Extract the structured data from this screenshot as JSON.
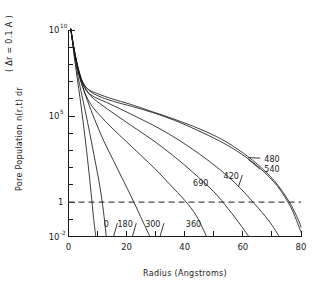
{
  "chart_data": {
    "type": "line",
    "title": "",
    "xlabel": "Radius (Angstroms)",
    "ylabel_main": "Pore Population  n(r,t) dr",
    "ylabel_note": "( Δr = 0.1 A )",
    "xlim": [
      0,
      80
    ],
    "ylim_log10": [
      -2,
      10
    ],
    "xticks": [
      0,
      10,
      20,
      30,
      40,
      50,
      60,
      70,
      80
    ],
    "xtick_labels": [
      "0",
      "",
      "20",
      "",
      "40",
      "",
      "60",
      "",
      "80"
    ],
    "ytick_log10": [
      -2,
      -1,
      0,
      1,
      2,
      3,
      4,
      5,
      6,
      7,
      8,
      9,
      10
    ],
    "ytick_labels": [
      {
        "value_log10": 10,
        "mantissa": "10",
        "exponent": "10"
      },
      {
        "value_log10": 5,
        "mantissa": "10",
        "exponent": "5"
      },
      {
        "value_log10": 0,
        "mantissa": "1",
        "exponent": ""
      },
      {
        "value_log10": -2,
        "mantissa": "10",
        "exponent": "-2"
      }
    ],
    "grid": false,
    "legend_position": "inline-curve-labels",
    "reference_line": {
      "y_log10": 0,
      "label": "1",
      "style": "dashed"
    },
    "series": [
      {
        "name": "0",
        "label": "0",
        "label_x": 13,
        "label_y_log10": -1.45,
        "points": [
          [
            0.8,
            10.05
          ],
          [
            1.2,
            9.6
          ],
          [
            2.0,
            8.4
          ],
          [
            3.0,
            7.2
          ],
          [
            4.0,
            6.0
          ],
          [
            5.0,
            4.7
          ],
          [
            6.0,
            3.3
          ],
          [
            7.0,
            1.8
          ],
          [
            7.8,
            0.5
          ],
          [
            8.6,
            -0.9
          ],
          [
            9.4,
            -2.0
          ]
        ]
      },
      {
        "name": "180",
        "label": "180",
        "label_x": 19.5,
        "label_y_log10": -1.45,
        "points": [
          [
            0.8,
            10.05
          ],
          [
            1.5,
            9.2
          ],
          [
            2.5,
            8.1
          ],
          [
            3.5,
            7.1
          ],
          [
            5.0,
            5.9
          ],
          [
            6.5,
            4.7
          ],
          [
            8.0,
            3.4
          ],
          [
            9.5,
            2.1
          ],
          [
            10.8,
            0.9
          ],
          [
            12.0,
            -0.5
          ],
          [
            13.0,
            -2.0
          ]
        ]
      },
      {
        "name": "300",
        "label": "300",
        "label_x": 29,
        "label_y_log10": -1.45,
        "points": [
          [
            0.8,
            10.05
          ],
          [
            1.6,
            9.1
          ],
          [
            3.0,
            7.8
          ],
          [
            4.5,
            6.9
          ],
          [
            6.5,
            5.9
          ],
          [
            9.0,
            4.8
          ],
          [
            12.0,
            3.6
          ],
          [
            15.5,
            2.4
          ],
          [
            19.0,
            1.2
          ],
          [
            22.5,
            0.0
          ],
          [
            25.5,
            -1.1
          ],
          [
            28.0,
            -2.0
          ]
        ]
      },
      {
        "name": "360",
        "label": "360",
        "label_x": 43,
        "label_y_log10": -1.45,
        "points": [
          [
            0.8,
            10.05
          ],
          [
            1.8,
            9.0
          ],
          [
            3.5,
            7.5
          ],
          [
            5.5,
            6.4
          ],
          [
            8.0,
            5.6
          ],
          [
            11.0,
            5.0
          ],
          [
            15.0,
            4.3
          ],
          [
            20.0,
            3.5
          ],
          [
            25.0,
            2.7
          ],
          [
            30.0,
            1.9
          ],
          [
            35.0,
            1.0
          ],
          [
            40.0,
            0.1
          ],
          [
            44.0,
            -0.8
          ],
          [
            47.5,
            -2.0
          ]
        ]
      },
      {
        "name": "690",
        "label": "690",
        "label_x": 45.5,
        "label_y_log10": 0.92,
        "points": [
          [
            0.8,
            10.05
          ],
          [
            1.7,
            9.1
          ],
          [
            3.2,
            7.9
          ],
          [
            5.0,
            6.9
          ],
          [
            7.5,
            6.2
          ],
          [
            11.0,
            5.7
          ],
          [
            16.0,
            5.1
          ],
          [
            22.0,
            4.4
          ],
          [
            29.0,
            3.6
          ],
          [
            36.0,
            2.7
          ],
          [
            43.0,
            1.7
          ],
          [
            50.0,
            0.6
          ],
          [
            55.0,
            -0.4
          ],
          [
            59.5,
            -1.4
          ],
          [
            62.0,
            -2.0
          ]
        ]
      },
      {
        "name": "420",
        "label": "420",
        "label_x": 56,
        "label_y_log10": 1.35,
        "points": [
          [
            0.8,
            10.05
          ],
          [
            1.9,
            8.9
          ],
          [
            3.8,
            7.4
          ],
          [
            6.0,
            6.5
          ],
          [
            9.0,
            6.1
          ],
          [
            13.0,
            5.8
          ],
          [
            18.0,
            5.4
          ],
          [
            24.0,
            4.9
          ],
          [
            31.0,
            4.3
          ],
          [
            38.0,
            3.6
          ],
          [
            45.0,
            2.8
          ],
          [
            52.0,
            1.9
          ],
          [
            58.0,
            1.0
          ],
          [
            64.0,
            -0.1
          ],
          [
            69.0,
            -1.1
          ],
          [
            72.5,
            -2.0
          ]
        ]
      },
      {
        "name": "480",
        "label": "480",
        "label_x": 70,
        "label_y_log10": 2.35,
        "points": [
          [
            0.8,
            10.05
          ],
          [
            2.0,
            8.8
          ],
          [
            4.0,
            7.3
          ],
          [
            6.5,
            6.6
          ],
          [
            10.0,
            6.3
          ],
          [
            15.0,
            6.0
          ],
          [
            21.0,
            5.7
          ],
          [
            28.0,
            5.3
          ],
          [
            35.0,
            4.9
          ],
          [
            43.0,
            4.4
          ],
          [
            51.0,
            3.8
          ],
          [
            58.0,
            3.1
          ],
          [
            65.0,
            2.2
          ],
          [
            71.0,
            1.2
          ],
          [
            76.0,
            0.0
          ],
          [
            79.0,
            -1.0
          ],
          [
            80.0,
            -1.45
          ]
        ]
      },
      {
        "name": "540",
        "label": "540",
        "label_x": 70,
        "label_y_log10": 1.72,
        "points": [
          [
            0.8,
            10.05
          ],
          [
            2.1,
            8.7
          ],
          [
            4.3,
            7.2
          ],
          [
            7.0,
            6.5
          ],
          [
            10.5,
            6.15
          ],
          [
            15.5,
            5.85
          ],
          [
            22.0,
            5.55
          ],
          [
            29.0,
            5.2
          ],
          [
            36.5,
            4.75
          ],
          [
            44.0,
            4.2
          ],
          [
            52.0,
            3.55
          ],
          [
            59.0,
            2.85
          ],
          [
            66.0,
            1.95
          ],
          [
            72.0,
            0.9
          ],
          [
            76.5,
            -0.3
          ],
          [
            79.0,
            -1.3
          ],
          [
            80.0,
            -1.75
          ]
        ]
      }
    ]
  },
  "axes": {
    "x_title": "Radius (Angstroms)",
    "y_title_part1": "Pore Population",
    "y_title_part2": "n(r,t) dr",
    "y_title_part3": "( Δr = 0.1 A )"
  }
}
